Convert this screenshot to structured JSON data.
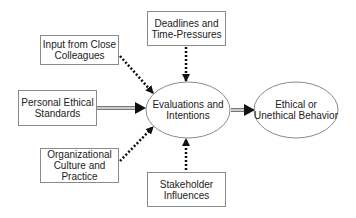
{
  "diagram": {
    "nodes": {
      "deadlines": {
        "label_line1": "Deadlines and",
        "label_line2": "Time-Pressures",
        "shape": "rectangle"
      },
      "colleagues": {
        "label_line1": "Input from Close",
        "label_line2": "Colleagues",
        "shape": "rectangle"
      },
      "personal": {
        "label_line1": "Personal Ethical",
        "label_line2": "Standards",
        "shape": "rectangle"
      },
      "organizational": {
        "label_line1": "Organizational",
        "label_line2": "Culture and",
        "label_line3": "Practice",
        "shape": "rectangle"
      },
      "stakeholder": {
        "label_line1": "Stakeholder",
        "label_line2": "Influences",
        "shape": "rectangle"
      },
      "evaluations": {
        "label_line1": "Evaluations and",
        "label_line2": "Intentions",
        "shape": "ellipse"
      },
      "behavior": {
        "label_line1": "Ethical or",
        "label_line2": "Unethical Behavior",
        "shape": "ellipse"
      }
    },
    "edges": [
      {
        "from": "deadlines",
        "to": "evaluations",
        "style": "dotted"
      },
      {
        "from": "colleagues",
        "to": "evaluations",
        "style": "dotted"
      },
      {
        "from": "personal",
        "to": "evaluations",
        "style": "double-line"
      },
      {
        "from": "organizational",
        "to": "evaluations",
        "style": "dotted"
      },
      {
        "from": "stakeholder",
        "to": "evaluations",
        "style": "dotted"
      },
      {
        "from": "evaluations",
        "to": "behavior",
        "style": "double-line"
      }
    ],
    "colors": {
      "border": "#8a8a8a",
      "arrow": "#111111",
      "text": "#222222",
      "double_line_fill": "#bdbdbd"
    }
  }
}
